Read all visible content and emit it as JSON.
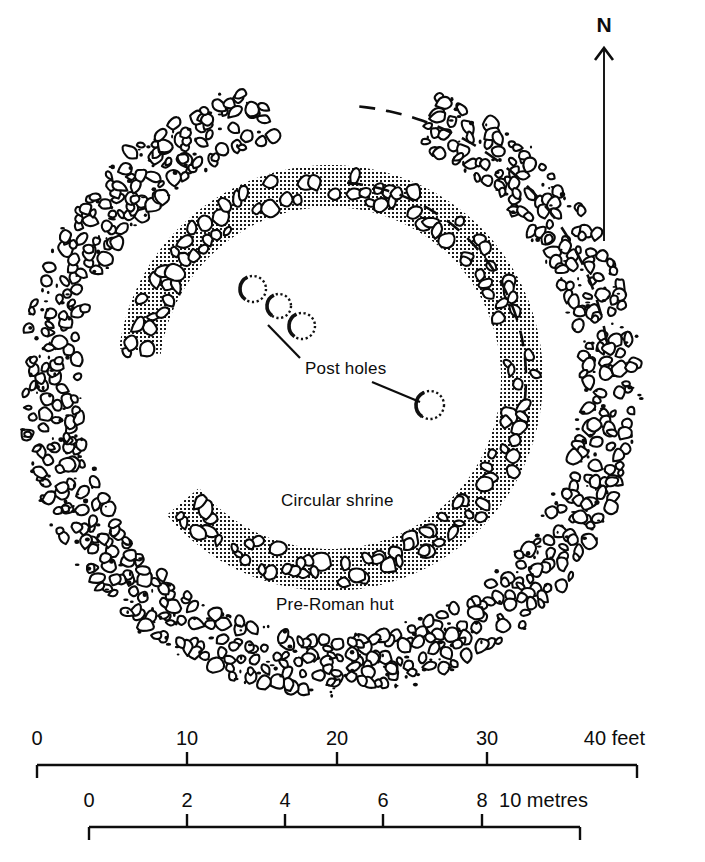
{
  "figure": {
    "type": "archaeological-site-plan"
  },
  "north_arrow": {
    "label": "N",
    "letter_x": 604,
    "letter_y": 32,
    "shaft_x": 604,
    "shaft_top": 48,
    "shaft_bottom": 241
  },
  "labels": [
    {
      "id": "post-holes",
      "text": "Post holes",
      "x": 305,
      "y": 374,
      "anchor": "start",
      "leaders": [
        {
          "x1": 300,
          "y1": 358,
          "x2": 268,
          "y2": 325
        },
        {
          "x1": 372,
          "y1": 382,
          "x2": 420,
          "y2": 402
        }
      ]
    },
    {
      "id": "circular-shrine",
      "text": "Circular shrine",
      "x": 281,
      "y": 506,
      "anchor": "start",
      "leaders": []
    },
    {
      "id": "pre-roman-hut",
      "text": "Pre-Roman hut",
      "x": 276,
      "y": 610,
      "anchor": "start",
      "leaders": []
    }
  ],
  "post_holes": [
    {
      "cx": 253,
      "cy": 289,
      "r": 13
    },
    {
      "cx": 279,
      "cy": 306,
      "r": 12
    },
    {
      "cx": 302,
      "cy": 326,
      "r": 13
    },
    {
      "cx": 430,
      "cy": 405,
      "r": 14
    }
  ],
  "features": {
    "outer_ring": {
      "name": "Pre-Roman hut",
      "style": "stone-rubble-band",
      "center_x": 330,
      "center_y": 385,
      "radius": 280,
      "band_width": 58,
      "start_deg": 291,
      "end_deg": 618
    },
    "inner_ring": {
      "name": "Circular shrine",
      "style": "stippled-band-with-stones",
      "center_x": 330,
      "center_y": 378,
      "radius": 192,
      "band_width": 42,
      "start_deg": 188,
      "end_deg": 500
    },
    "conjectural_arcs": [
      {
        "name": "outer-conjectural-arc",
        "center_x": 330,
        "center_y": 385,
        "radius": 280,
        "start_deg": 276,
        "end_deg": 352
      },
      {
        "name": "inner-conjectural-arc",
        "center_x": 330,
        "center_y": 378,
        "radius": 196,
        "start_deg": 275,
        "end_deg": 368
      }
    ]
  },
  "scales": [
    {
      "id": "feet-scale",
      "unit": "feet",
      "unit_label": "40 feet",
      "x_start": 37,
      "x_end": 637,
      "y": 765,
      "tick_height": 13,
      "ticks": [
        {
          "value": "0",
          "x": 37,
          "end": true
        },
        {
          "value": "10",
          "x": 187,
          "end": false
        },
        {
          "value": "20",
          "x": 337,
          "end": false
        },
        {
          "value": "30",
          "x": 487,
          "end": false
        },
        {
          "value": "40",
          "x": 637,
          "end": true
        }
      ]
    },
    {
      "id": "metres-scale",
      "unit": "metres",
      "unit_label": "10 metres",
      "x_start": 89,
      "x_end": 580,
      "y": 827,
      "tick_height": 13,
      "ticks": [
        {
          "value": "0",
          "x": 89,
          "end": true
        },
        {
          "value": "2",
          "x": 187,
          "end": false
        },
        {
          "value": "4",
          "x": 285,
          "end": false
        },
        {
          "value": "6",
          "x": 383,
          "end": false
        },
        {
          "value": "8",
          "x": 482,
          "end": false
        },
        {
          "value": "10",
          "x": 580,
          "end": true
        }
      ]
    }
  ],
  "colors": {
    "ink": "#0d0d0d",
    "paper": "#ffffff",
    "stipple": "#1a1a1a"
  }
}
